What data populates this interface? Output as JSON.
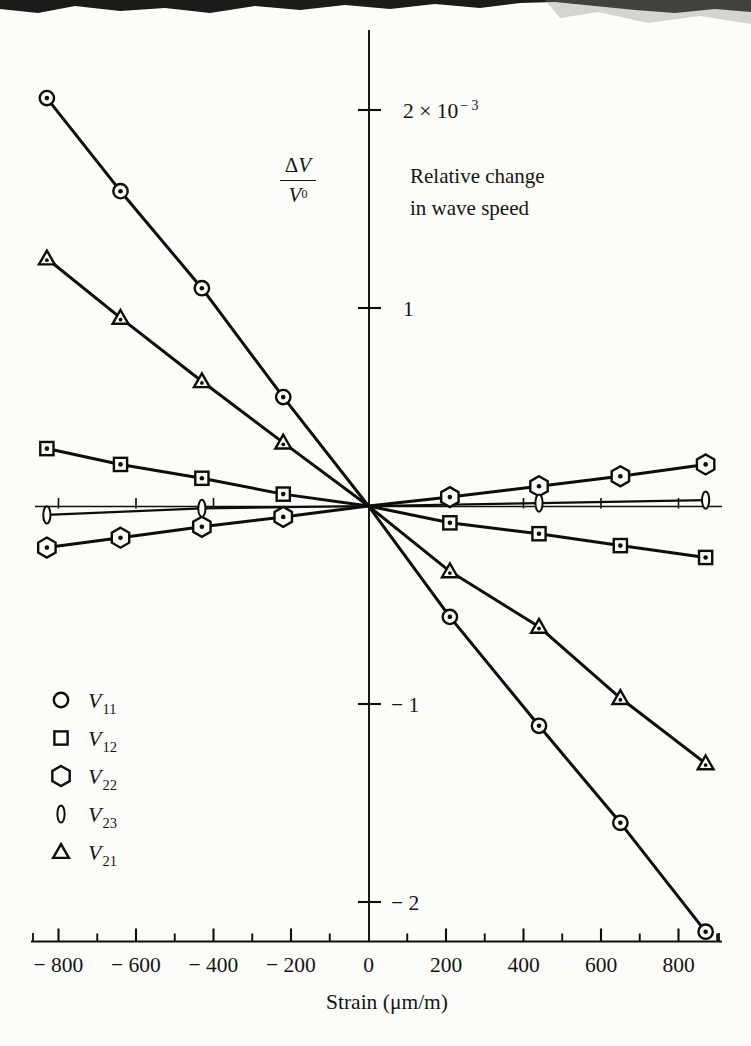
{
  "figure": {
    "kind": "scanned-book-figure",
    "background": "#fcfcfa",
    "ink_color": "#0d0d0d"
  },
  "overlays": {
    "fraction": {
      "delta": "Δ",
      "num_v": "V",
      "den_v": "V",
      "den_sup": "0"
    },
    "description_line1": "Relative change",
    "description_line2": "in wave speed"
  },
  "chart_data": {
    "type": "scatter",
    "title": "Relative change in wave speed",
    "xlabel": "Strain (μm/m)",
    "ylabel": "ΔV / V⁰",
    "y_unit_note": "× 10⁻³",
    "xlim": [
      -870,
      910
    ],
    "ylim_e3": [
      -2.2,
      2.3
    ],
    "x_major_ticks": [
      -800,
      -600,
      -400,
      -200,
      0,
      200,
      400,
      600,
      800
    ],
    "x_major_tick_labels": [
      "− 800",
      "− 600",
      "− 400",
      "− 200",
      "0",
      "200",
      "400",
      "600",
      "800"
    ],
    "x_minor_ticks": [
      -700,
      -500,
      -300,
      -100,
      100,
      300,
      500,
      700,
      900
    ],
    "y_ticks": [
      {
        "value_e3": 2,
        "label": "2 × 10",
        "sup": "− 3"
      },
      {
        "value_e3": 1,
        "label": "1"
      },
      {
        "value_e3": -1,
        "label": "− 1"
      },
      {
        "value_e3": -2,
        "label": "− 2"
      }
    ],
    "zero_line_ticks": [
      -800,
      -600,
      -400,
      400,
      600,
      800
    ],
    "series": [
      {
        "name": "V11",
        "marker": "circle",
        "points_e3": [
          [
            -830,
            2.06
          ],
          [
            -640,
            1.59
          ],
          [
            -430,
            1.1
          ],
          [
            -220,
            0.55
          ],
          [
            0,
            0
          ],
          [
            210,
            -0.56
          ],
          [
            440,
            -1.11
          ],
          [
            650,
            -1.6
          ],
          [
            870,
            -2.15
          ]
        ]
      },
      {
        "name": "V21",
        "marker": "triangle",
        "points_e3": [
          [
            -830,
            1.25
          ],
          [
            -640,
            0.95
          ],
          [
            -430,
            0.63
          ],
          [
            -220,
            0.32
          ],
          [
            0,
            0
          ],
          [
            210,
            -0.33
          ],
          [
            440,
            -0.61
          ],
          [
            650,
            -0.97
          ],
          [
            870,
            -1.3
          ]
        ]
      },
      {
        "name": "V12",
        "marker": "square",
        "points_e3": [
          [
            -830,
            0.29
          ],
          [
            -640,
            0.21
          ],
          [
            -430,
            0.14
          ],
          [
            -220,
            0.06
          ],
          [
            0,
            0
          ],
          [
            210,
            -0.085
          ],
          [
            440,
            -0.14
          ],
          [
            650,
            -0.2
          ],
          [
            870,
            -0.26
          ]
        ]
      },
      {
        "name": "V22",
        "marker": "hexagon",
        "points_e3": [
          [
            -830,
            -0.21
          ],
          [
            -640,
            -0.16
          ],
          [
            -430,
            -0.105
          ],
          [
            -220,
            -0.055
          ],
          [
            0,
            0
          ],
          [
            210,
            0.045
          ],
          [
            440,
            0.1
          ],
          [
            650,
            0.15
          ],
          [
            870,
            0.21
          ]
        ]
      },
      {
        "name": "V23",
        "marker": "ellipse",
        "points_e3": [
          [
            -830,
            -0.045
          ],
          [
            -430,
            -0.012
          ],
          [
            0,
            0
          ],
          [
            440,
            0.015
          ],
          [
            870,
            0.03
          ]
        ]
      }
    ],
    "legend": [
      {
        "marker": "circle",
        "label": "V",
        "sub": "11"
      },
      {
        "marker": "square",
        "label": "V",
        "sub": "12"
      },
      {
        "marker": "hexagon",
        "label": "V",
        "sub": "22"
      },
      {
        "marker": "ellipse",
        "label": "V",
        "sub": "23"
      },
      {
        "marker": "triangle",
        "label": "V",
        "sub": "21"
      }
    ],
    "legend_position": "lower-left",
    "grid": false
  }
}
